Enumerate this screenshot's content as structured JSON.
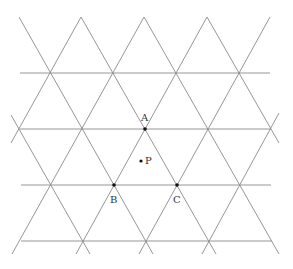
{
  "diagram": {
    "type": "triangular-lattice",
    "colors": {
      "line": "#8a8a8a",
      "point": "#111111",
      "label": "#333333",
      "background": "#ffffff"
    },
    "horizontal_lines": [
      {
        "y": 73,
        "x1": 20,
        "x2": 270
      },
      {
        "y": 129,
        "x1": 20,
        "x2": 271
      },
      {
        "y": 185,
        "x1": 21,
        "x2": 271
      },
      {
        "y": 241,
        "x1": 21,
        "x2": 272
      }
    ],
    "down_right_lines": [
      {
        "x1": 19,
        "y1": 17,
        "x2": 153,
        "y2": 254
      },
      {
        "x1": 81,
        "y1": 17,
        "x2": 216,
        "y2": 254
      },
      {
        "x1": 144,
        "y1": 17,
        "x2": 279,
        "y2": 254
      },
      {
        "x1": 207,
        "y1": 17,
        "x2": 279,
        "y2": 143
      },
      {
        "x1": 11,
        "y1": 115,
        "x2": 90,
        "y2": 254
      }
    ],
    "down_left_lines": [
      {
        "x1": 81,
        "y1": 17,
        "x2": 11,
        "y2": 143
      },
      {
        "x1": 144,
        "y1": 17,
        "x2": 12,
        "y2": 254
      },
      {
        "x1": 207,
        "y1": 17,
        "x2": 76,
        "y2": 254
      },
      {
        "x1": 270,
        "y1": 17,
        "x2": 139,
        "y2": 254
      },
      {
        "x1": 279,
        "y1": 113,
        "x2": 202,
        "y2": 254
      }
    ],
    "points": [
      {
        "name": "A",
        "x": 145,
        "y": 129,
        "label": "A",
        "label_x": 141,
        "label_y": 121
      },
      {
        "name": "B",
        "x": 114,
        "y": 185,
        "label": "B",
        "label_x": 110,
        "label_y": 203
      },
      {
        "name": "C",
        "x": 177,
        "y": 185,
        "label": "C",
        "label_x": 173,
        "label_y": 203
      },
      {
        "name": "P",
        "x": 141,
        "y": 161,
        "label": "P",
        "label_x": 145,
        "label_y": 164
      }
    ]
  }
}
